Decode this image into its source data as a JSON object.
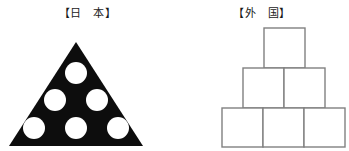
{
  "canvas": {
    "width": 349,
    "height": 151,
    "background_color": "#ffffff"
  },
  "panels": [
    {
      "id": "japan",
      "label": "【日　本】",
      "figure_name": "filled-triangle-with-holes",
      "shape": "triangle",
      "fill_color": "#0d0d0d",
      "hole_color": "#ffffff",
      "unit_count": 6,
      "rows": [
        1,
        2,
        3
      ],
      "circles": [
        {
          "cx": 76,
          "cy": 73,
          "r": 11
        },
        {
          "cx": 55,
          "cy": 100,
          "r": 11
        },
        {
          "cx": 97,
          "cy": 100,
          "r": 11
        },
        {
          "cx": 34,
          "cy": 128,
          "r": 11
        },
        {
          "cx": 76,
          "cy": 128,
          "r": 11
        },
        {
          "cx": 118,
          "cy": 128,
          "r": 11
        }
      ],
      "triangle_points": "76,42 143,146 9,146"
    },
    {
      "id": "foreign",
      "label": "【外　国】",
      "figure_name": "stacked-boxes-pyramid",
      "shape": "boxes",
      "fill_color": "#ffffff",
      "stroke_color": "#808080",
      "unit_count": 6,
      "rows": [
        1,
        2,
        3
      ],
      "boxes": [
        {
          "x": 89,
          "y": 28,
          "w": 41,
          "h": 40
        },
        {
          "x": 68,
          "y": 68,
          "w": 41,
          "h": 40
        },
        {
          "x": 109,
          "y": 68,
          "w": 41,
          "h": 40
        },
        {
          "x": 47,
          "y": 108,
          "w": 41,
          "h": 39
        },
        {
          "x": 88,
          "y": 108,
          "w": 41,
          "h": 39
        },
        {
          "x": 129,
          "y": 108,
          "w": 41,
          "h": 39
        }
      ]
    }
  ]
}
